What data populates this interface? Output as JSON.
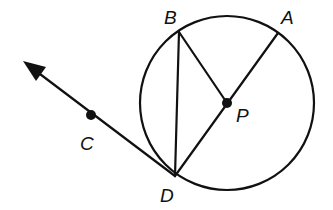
{
  "diagram": {
    "type": "geometry",
    "colors": {
      "stroke": "#111111",
      "background": "#ffffff"
    },
    "circle": {
      "center": "P",
      "cx": 227,
      "cy": 103,
      "r": 87
    },
    "points": {
      "A": {
        "label": "A",
        "x": 278,
        "y": 33
      },
      "B": {
        "label": "B",
        "x": 179,
        "y": 32
      },
      "P": {
        "label": "P",
        "x": 227,
        "y": 103
      },
      "C": {
        "label": "C",
        "x": 91,
        "y": 115
      },
      "D": {
        "label": "D",
        "x": 175,
        "y": 176
      }
    },
    "segments": [
      {
        "from": "B",
        "to": "D"
      },
      {
        "from": "B",
        "to": "P"
      },
      {
        "from": "A",
        "to": "D"
      }
    ],
    "rays": [
      {
        "from": "D",
        "through": "C"
      }
    ],
    "labels": {
      "A": "A",
      "B": "B",
      "C": "C",
      "D": "D",
      "P": "P"
    }
  }
}
